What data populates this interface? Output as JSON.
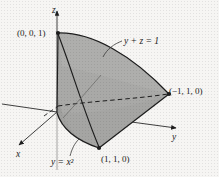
{
  "figure": {
    "kind": "3d-solid-region-diagram",
    "background_color": "#f6f5f3",
    "ink_color": "#1d1d1d",
    "fill_color_front": "#a9a9a7",
    "fill_color_left": "#9c9c9a",
    "fill_color_top": "#b4b4b2"
  },
  "axes": [
    {
      "id": "x",
      "label": "x",
      "label_x": 16,
      "label_y": 150
    },
    {
      "id": "y",
      "label": "y",
      "label_x": 172,
      "label_y": 133
    },
    {
      "id": "z",
      "label": "z",
      "label_x": 52,
      "label_y": 6
    }
  ],
  "annotations": [
    {
      "id": "vertex-001",
      "text": "(0, 0, 1)",
      "x": 17,
      "y": 29,
      "font_size": 9,
      "italic": false,
      "kind": "point-label"
    },
    {
      "id": "plane-equation",
      "text": "y + z = 1",
      "x": 124,
      "y": 37,
      "font_size": 9.5,
      "italic": true,
      "kind": "surface-label"
    },
    {
      "id": "vertex-m110",
      "text": "(−1, 1, 0)",
      "x": 169,
      "y": 87,
      "font_size": 9,
      "italic": false,
      "kind": "point-label"
    },
    {
      "id": "vertex-110",
      "text": "(1, 1, 0)",
      "x": 101,
      "y": 155,
      "font_size": 9,
      "italic": false,
      "kind": "point-label"
    },
    {
      "id": "parabola-equation",
      "text": "y = x²",
      "x": 51,
      "y": 158,
      "font_size": 9.5,
      "italic": true,
      "kind": "curve-label"
    }
  ],
  "points": [
    {
      "name": "origin",
      "px": 57,
      "py": 112
    },
    {
      "name": "top-vertex-001",
      "px": 58,
      "py": 33
    },
    {
      "name": "right-vertex-m110",
      "px": 169,
      "py": 94
    },
    {
      "name": "front-vertex-110",
      "px": 99,
      "py": 148
    }
  ],
  "geometry_notes": {
    "solid_outline": "Top arc from (0,0,1) bulging right to (-1,1,0); straight edge down-left to (1,1,0); parabolic bottom edge back to the z-axis foot",
    "dashed_curves": "Hidden parabolic arc in the y-z base plane from near origin out to (-1,1,0), plus hidden base edge",
    "solid_curves": "Front parabola y=x^2 descending from (0,0,1) through origin region to (1,1,0)"
  }
}
